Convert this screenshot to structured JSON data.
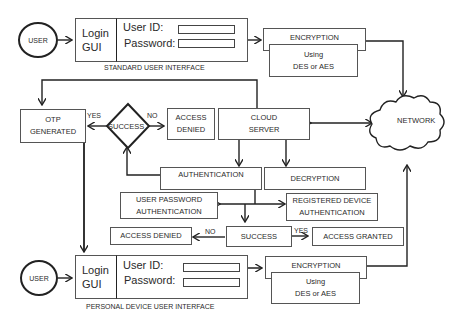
{
  "standard_ui": {
    "user": "USER",
    "login": "Login",
    "gui": "GUI",
    "user_id_label": "User ID:",
    "password_label": "Password:",
    "caption": "STANDARD USER INTERFACE",
    "encryption": "ENCRYPTION",
    "using": "Using",
    "algo": "DES or AES"
  },
  "network": "NETWORK",
  "otp": {
    "line1": "OTP",
    "line2": "GENERATED"
  },
  "decision": {
    "label": "SUCCESS",
    "yes": "YES",
    "no": "NO"
  },
  "access_denied_top": {
    "line1": "ACCESS",
    "line2": "DENIED"
  },
  "cloud": {
    "line1": "CLOUD",
    "line2": "SERVER"
  },
  "authentication": "AUTHENTICATION",
  "decryption": "DECRYPTION",
  "user_pw_auth": {
    "line1": "USER PASSWORD",
    "line2": "AUTHENTICATION"
  },
  "reg_device_auth": {
    "line1": "REGISTERED DEVICE",
    "line2": "AUTHENTICATION"
  },
  "bottom_decision": {
    "denied": "ACCESS DENIED",
    "no": "NO",
    "success": "SUCCESS",
    "yes": "YES",
    "granted": "ACCESS GRANTED"
  },
  "personal_ui": {
    "user": "USER",
    "login": "Login",
    "gui": "GUI",
    "user_id_label": "User ID:",
    "password_label": "Password:",
    "caption": "PERSONAL DEVICE USER INTERFACE",
    "encryption": "ENCRYPTION",
    "using": "Using",
    "algo": "DES or AES"
  }
}
